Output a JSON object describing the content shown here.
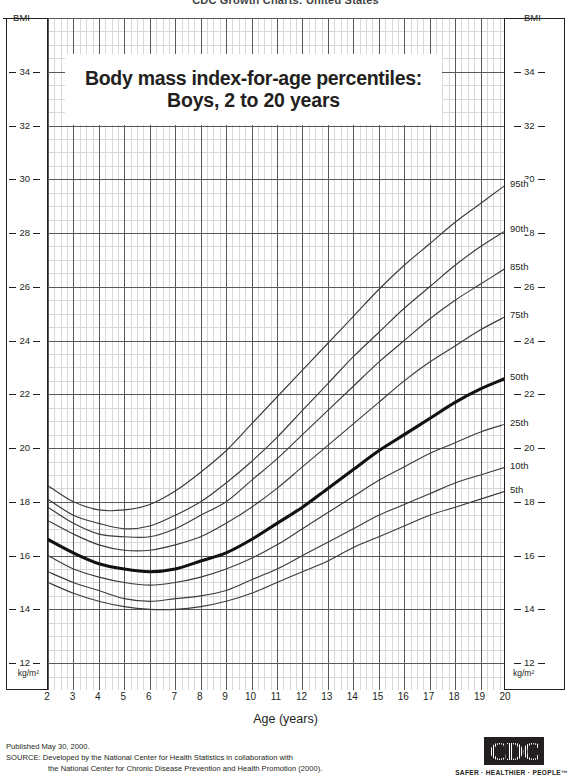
{
  "header": {
    "cut_off_text": "CDC Growth Charts: United States"
  },
  "title": {
    "line1": "Body mass index-for-age percentiles:",
    "line2": "Boys, 2 to 20 years"
  },
  "axes": {
    "y_top_label": "BMI",
    "y_bottom_label": "kg/m²",
    "y_ticks": [
      "34",
      "32",
      "30",
      "28",
      "26",
      "24",
      "22",
      "20",
      "18",
      "16",
      "14",
      "12"
    ],
    "x_title": "Age (years)",
    "x_ticks": [
      "2",
      "3",
      "4",
      "5",
      "6",
      "7",
      "8",
      "9",
      "10",
      "11",
      "12",
      "13",
      "14",
      "15",
      "16",
      "17",
      "18",
      "19",
      "20"
    ]
  },
  "percentile_labels": [
    "95th",
    "90th",
    "85th",
    "75th",
    "50th",
    "25th",
    "10th",
    "5th"
  ],
  "footer": {
    "published": "Published May 30, 2000.",
    "source_line1": "SOURCE: Developed by the National Center for Health Statistics in collaboration with",
    "source_line2": "the National Center for Chronic Disease Prevention and Health Promotion (2000)."
  },
  "logo": {
    "mark": "CDC",
    "tagline": "SAFER · HEALTHIER · PEOPLE™"
  },
  "colors": {
    "ink": "#231f20",
    "grid_major": "#58595b",
    "grid_minor": "#d7d8da",
    "curve": "#3b3b3d",
    "curve_median": "#111111"
  },
  "chart_data": {
    "type": "line",
    "title": "Body mass index-for-age percentiles: Boys, 2 to 20 years",
    "xlabel": "Age (years)",
    "ylabel": "BMI",
    "xlim": [
      2,
      20
    ],
    "ylim": [
      11,
      36
    ],
    "y_major_step": 2,
    "y_minor_step": 0.5,
    "x_major_step": 1,
    "x_minor_step": 0.25,
    "grid": true,
    "legend": "inline-right-labels",
    "x": [
      2,
      3,
      4,
      5,
      6,
      7,
      8,
      9,
      10,
      11,
      12,
      13,
      14,
      15,
      16,
      17,
      18,
      19,
      20
    ],
    "series": [
      {
        "name": "5th",
        "values": [
          15.0,
          14.6,
          14.3,
          14.1,
          14.0,
          14.0,
          14.1,
          14.3,
          14.6,
          15.0,
          15.4,
          15.8,
          16.3,
          16.7,
          17.1,
          17.5,
          17.8,
          18.1,
          18.4
        ]
      },
      {
        "name": "10th",
        "values": [
          15.4,
          15.0,
          14.7,
          14.4,
          14.3,
          14.4,
          14.5,
          14.7,
          15.1,
          15.5,
          16.0,
          16.5,
          17.0,
          17.5,
          17.9,
          18.3,
          18.7,
          19.0,
          19.3
        ]
      },
      {
        "name": "25th",
        "values": [
          16.0,
          15.5,
          15.2,
          15.0,
          14.9,
          15.0,
          15.2,
          15.5,
          15.9,
          16.4,
          17.0,
          17.6,
          18.2,
          18.8,
          19.3,
          19.8,
          20.2,
          20.6,
          20.9
        ]
      },
      {
        "name": "50th",
        "values": [
          16.6,
          16.1,
          15.7,
          15.5,
          15.4,
          15.5,
          15.8,
          16.1,
          16.6,
          17.2,
          17.8,
          18.5,
          19.2,
          19.9,
          20.5,
          21.1,
          21.7,
          22.2,
          22.6
        ]
      },
      {
        "name": "75th",
        "values": [
          17.3,
          16.8,
          16.4,
          16.2,
          16.2,
          16.4,
          16.7,
          17.2,
          17.8,
          18.5,
          19.3,
          20.1,
          20.9,
          21.7,
          22.5,
          23.2,
          23.8,
          24.4,
          24.9
        ]
      },
      {
        "name": "85th",
        "values": [
          17.8,
          17.2,
          16.8,
          16.7,
          16.7,
          17.0,
          17.5,
          18.0,
          18.8,
          19.6,
          20.5,
          21.4,
          22.3,
          23.2,
          24.0,
          24.8,
          25.5,
          26.1,
          26.7
        ]
      },
      {
        "name": "90th",
        "values": [
          18.1,
          17.5,
          17.2,
          17.0,
          17.1,
          17.5,
          18.0,
          18.7,
          19.5,
          20.4,
          21.4,
          22.4,
          23.4,
          24.3,
          25.2,
          26.0,
          26.8,
          27.5,
          28.1
        ]
      },
      {
        "name": "95th",
        "values": [
          18.6,
          18.0,
          17.7,
          17.7,
          17.9,
          18.4,
          19.1,
          19.9,
          20.9,
          21.9,
          22.9,
          23.9,
          24.9,
          25.9,
          26.8,
          27.6,
          28.4,
          29.1,
          29.8
        ]
      }
    ],
    "median_series": "50th"
  }
}
